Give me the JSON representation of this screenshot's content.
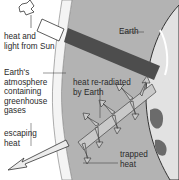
{
  "diagram": {
    "labels": {
      "sun": "heat and\nlight from Sun",
      "earth": "Earth",
      "atmosphere": "Earth's\natmosphere\ncontaining\ngreenhouse\ngases",
      "reradiated": "heat re-radiated\nby Earth",
      "escaping": "escaping\nheat",
      "trapped": "trapped\nheat"
    },
    "colors": {
      "background": "#ffffff",
      "atmosphere_fill": "#b3b3b3",
      "atmosphere_band": "#f2f2f2",
      "sun_ray": "#4d4d4d",
      "heat_arrow": "#c9c9c9",
      "earth": "#e6e6e6"
    }
  }
}
